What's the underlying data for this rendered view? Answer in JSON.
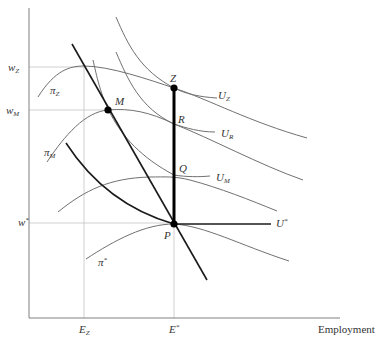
{
  "figure": {
    "x_axis_label": "Employment",
    "y_axis_ticks": [
      {
        "label": "w",
        "sub": "Z",
        "sup": ""
      },
      {
        "label": "w",
        "sub": "M",
        "sup": ""
      },
      {
        "label": "w",
        "sub": "",
        "sup": "*"
      }
    ],
    "x_axis_ticks": [
      {
        "label": "E",
        "sub": "Z",
        "sup": ""
      },
      {
        "label": "E",
        "sub": "",
        "sup": "*"
      }
    ],
    "points": [
      {
        "label": "Z"
      },
      {
        "label": "M"
      },
      {
        "label": "R"
      },
      {
        "label": "Q"
      },
      {
        "label": "P"
      }
    ],
    "curve_labels": {
      "UZ": {
        "label": "U",
        "sub": "Z"
      },
      "UR": {
        "label": "U",
        "sub": "R"
      },
      "UM": {
        "label": "U",
        "sub": "M"
      },
      "Ustar": {
        "label": "U",
        "sup": "*"
      },
      "piZ": {
        "label": "π",
        "sub": "Z"
      },
      "piM": {
        "label": "π",
        "sub": "M"
      },
      "piStar": {
        "label": "π",
        "sup": "*"
      }
    },
    "colors": {
      "thin_curve": "#666666",
      "thick_curve": "#111111",
      "axis": "#777777",
      "guide": "#bbbbbb"
    }
  }
}
